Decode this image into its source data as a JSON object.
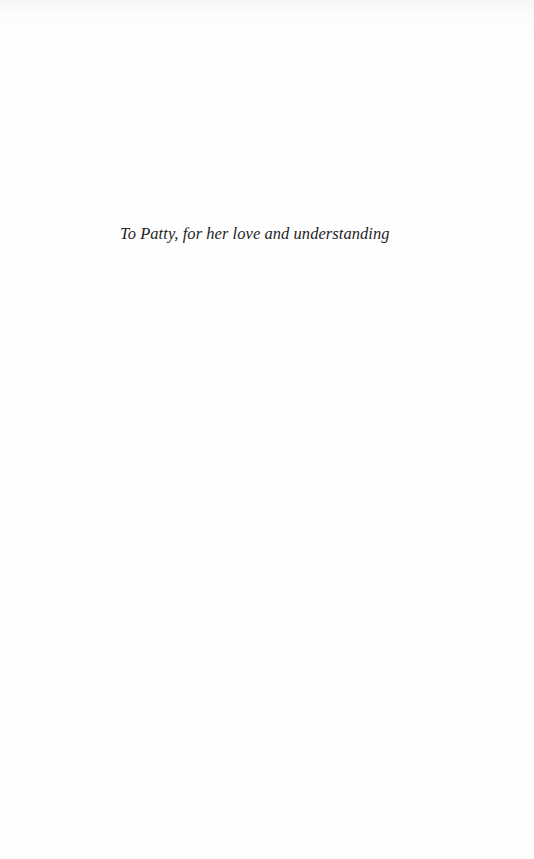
{
  "page": {
    "type": "dedication",
    "dedication_text": "To Patty, for her love and understanding",
    "colors": {
      "background": "#fdfdfd",
      "text": "#1f1f1f"
    }
  }
}
